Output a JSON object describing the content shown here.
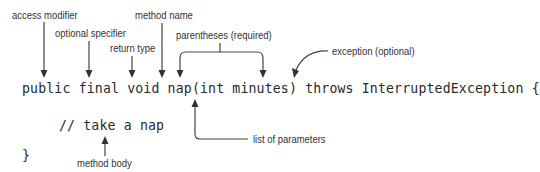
{
  "diagram": {
    "code": {
      "signature": "public final void nap(int minutes) throws InterruptedException {",
      "body_comment": "// take a nap",
      "closing_brace": "}"
    },
    "annotations": {
      "access_modifier": "access modifier",
      "optional_specifier": "optional specifier",
      "return_type": "return type",
      "method_name": "method name",
      "parentheses": "parentheses (required)",
      "exception": "exception (optional)",
      "parameters": "list of parameters",
      "method_body": "method body"
    },
    "colors": {
      "text": "#333333",
      "code": "#2a2a2a",
      "arrow": "#333333",
      "background": "#ffffff"
    }
  }
}
